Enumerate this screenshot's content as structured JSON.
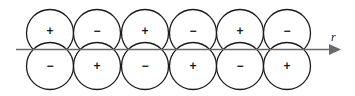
{
  "diagram": {
    "axis_label": "r",
    "columns": [
      {
        "top_sign": "+",
        "bottom_sign": "−"
      },
      {
        "top_sign": "−",
        "bottom_sign": "+"
      },
      {
        "top_sign": "+",
        "bottom_sign": "−"
      },
      {
        "top_sign": "−",
        "bottom_sign": "+"
      },
      {
        "top_sign": "+",
        "bottom_sign": "−"
      },
      {
        "top_sign": "−",
        "bottom_sign": "+"
      }
    ],
    "colors": {
      "outline": "#1a1a1a",
      "axis": "#6b6b6b",
      "background": "#ffffff"
    }
  }
}
